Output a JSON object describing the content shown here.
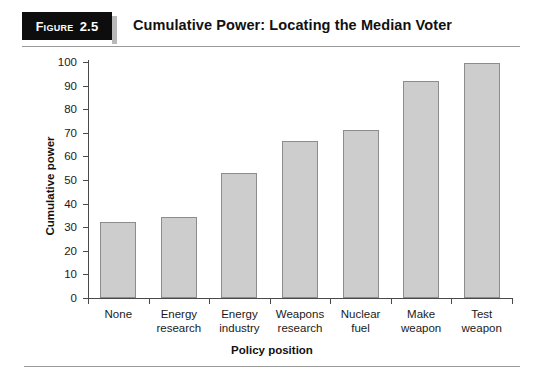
{
  "figure": {
    "label_word": "Figure",
    "number": "2.5",
    "title": "Cumulative Power: Locating the Median Voter"
  },
  "chart_data": {
    "type": "bar",
    "title": "Cumulative Power: Locating the Median Voter",
    "xlabel": "Policy position",
    "ylabel": "Cumulative power",
    "categories": [
      "None",
      "Energy research",
      "Energy industry",
      "Weapons research",
      "Nuclear fuel",
      "Make weapon",
      "Test weapon"
    ],
    "category_lines": [
      [
        "None"
      ],
      [
        "Energy",
        "research"
      ],
      [
        "Energy",
        "industry"
      ],
      [
        "Weapons",
        "research"
      ],
      [
        "Nuclear",
        "fuel"
      ],
      [
        "Make",
        "weapon"
      ],
      [
        "Test",
        "weapon"
      ]
    ],
    "values": [
      32,
      34.5,
      53,
      66.5,
      71,
      92,
      99.5
    ],
    "ylim": [
      0,
      100
    ],
    "ytick_labels": [
      "0",
      "10",
      "20",
      "30",
      "40",
      "50",
      "60",
      "70",
      "80",
      "90",
      "100"
    ],
    "yticks": [
      0,
      10,
      20,
      30,
      40,
      50,
      60,
      70,
      80,
      90,
      100
    ],
    "grid": false,
    "legend": null,
    "bar_fill": "#cdcdcd",
    "bar_stroke": "#8c8c8c",
    "axis_color": "#4a4a4a"
  }
}
